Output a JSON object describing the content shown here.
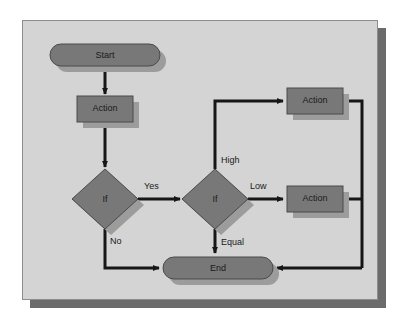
{
  "diagram": {
    "type": "flowchart",
    "canvas": {
      "width": 410,
      "height": 328
    },
    "colors": {
      "page_background": "#ffffff",
      "frame_background": "#d4d4d4",
      "frame_border": "#8d8d8d",
      "frame_shadow": "#6b6b6b",
      "node_fill": "#787878",
      "node_border": "#4a4a4a",
      "node_shadow": "#9c9c9c",
      "connector": "#161616",
      "text": "#1a1a1a"
    },
    "nodes": [
      {
        "id": "start",
        "shape": "terminator",
        "label": "Start",
        "x": 50,
        "y": 44,
        "w": 110,
        "h": 22
      },
      {
        "id": "action1",
        "shape": "process",
        "label": "Action",
        "x": 77,
        "y": 96,
        "w": 56,
        "h": 26
      },
      {
        "id": "if1",
        "shape": "decision",
        "label": "If",
        "cx": 105,
        "cy": 199,
        "rx": 33,
        "ry": 30
      },
      {
        "id": "if2",
        "shape": "decision",
        "label": "If",
        "cx": 215,
        "cy": 199,
        "rx": 33,
        "ry": 30
      },
      {
        "id": "action2",
        "shape": "process",
        "label": "Action",
        "x": 287,
        "y": 88,
        "w": 56,
        "h": 26
      },
      {
        "id": "action3",
        "shape": "process",
        "label": "Action",
        "x": 287,
        "y": 186,
        "w": 56,
        "h": 26
      },
      {
        "id": "end",
        "shape": "terminator",
        "label": "End",
        "x": 163,
        "y": 257,
        "w": 110,
        "h": 22
      }
    ],
    "edges": [
      {
        "id": "start-action1",
        "from": "start",
        "to": "action1",
        "label": ""
      },
      {
        "id": "action1-if1",
        "from": "action1",
        "to": "if1",
        "label": ""
      },
      {
        "id": "if1-if2",
        "from": "if1",
        "to": "if2",
        "label": "Yes"
      },
      {
        "id": "if1-end",
        "from": "if1",
        "to": "end",
        "label": "No"
      },
      {
        "id": "if2-action2",
        "from": "if2",
        "to": "action2",
        "label": "High"
      },
      {
        "id": "if2-action3",
        "from": "if2",
        "to": "action3",
        "label": "Low"
      },
      {
        "id": "if2-end",
        "from": "if2",
        "to": "end",
        "label": "Equal"
      },
      {
        "id": "action2-end",
        "from": "action2",
        "to": "end",
        "label": ""
      },
      {
        "id": "action3-end",
        "from": "action3",
        "to": "end",
        "label": ""
      }
    ],
    "labels": {
      "start": "Start",
      "action1": "Action",
      "action2": "Action",
      "action3": "Action",
      "if1": "If",
      "if2": "If",
      "end": "End",
      "yes": "Yes",
      "no": "No",
      "high": "High",
      "low": "Low",
      "equal": "Equal"
    }
  }
}
